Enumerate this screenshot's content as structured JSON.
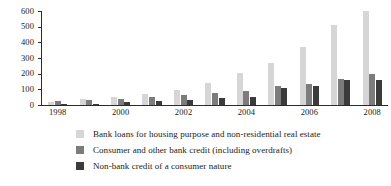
{
  "chart_data": {
    "type": "bar",
    "title": "",
    "subtitle": "",
    "xlabel": "",
    "ylabel": "",
    "ylim": [
      0,
      600
    ],
    "yticks": [
      0,
      100,
      200,
      300,
      400,
      500,
      600
    ],
    "grid": false,
    "legend_position": "bottom",
    "categories": [
      "1998",
      "1999",
      "2000",
      "2001",
      "2002",
      "2003",
      "2004",
      "2005",
      "2006",
      "2007",
      "2008"
    ],
    "tick_labels": [
      "1998",
      "",
      "2000",
      "",
      "2002",
      "",
      "2004",
      "",
      "2006",
      "",
      "2008"
    ],
    "series": [
      {
        "name": "Bank loans for housing purpose and non-residential real estate",
        "color": "#d6d6d6",
        "values": [
          22,
          38,
          50,
          70,
          97,
          140,
          205,
          268,
          372,
          510,
          598
        ]
      },
      {
        "name": "Consumer and other bank credit (including overdrafts)",
        "color": "#7c7c7c",
        "values": [
          28,
          35,
          40,
          48,
          62,
          75,
          88,
          121,
          133,
          163,
          200
        ]
      },
      {
        "name": "Non-bank credit of a consumer nature",
        "color": "#3b3b3b",
        "values": [
          2,
          8,
          20,
          25,
          32,
          45,
          50,
          110,
          123,
          157,
          157
        ]
      }
    ]
  }
}
